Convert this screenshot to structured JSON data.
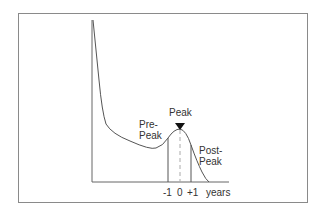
{
  "diagram": {
    "type": "lifecycle-curve",
    "peak_label": "Peak",
    "pre_peak_label": [
      "Pre-",
      "Peak"
    ],
    "post_peak_label": [
      "Post-",
      "Peak"
    ],
    "x_axis": {
      "ticks": [
        "-1",
        "0",
        "+1"
      ],
      "unit_label": "years"
    },
    "colors": {
      "curve": "#555555",
      "axis": "#666666",
      "frame": "#8a8a8a",
      "dashed": "#aaaaaa",
      "marker": "#111111"
    }
  }
}
